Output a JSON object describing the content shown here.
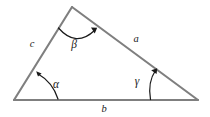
{
  "figure": {
    "background_color": "#ffffff",
    "side_color": "#7f7f7f",
    "annotation_color": "#1a1a1a",
    "vertices": {
      "bottom_left": [
        14,
        100
      ],
      "apex": [
        72,
        7
      ],
      "bottom_right": [
        198,
        100
      ]
    },
    "sides": [
      {
        "key": "a",
        "label": "a",
        "label_x": 136,
        "label_y": 42,
        "from": "apex",
        "to": "bottom_right"
      },
      {
        "key": "b",
        "label": "b",
        "label_x": 104,
        "label_y": 112,
        "from": "bottom_left",
        "to": "bottom_right"
      },
      {
        "key": "c",
        "label": "c",
        "label_x": 32,
        "label_y": 47,
        "from": "bottom_left",
        "to": "apex"
      }
    ],
    "angles": [
      {
        "key": "alpha",
        "label": "α",
        "label_x": 56,
        "label_y": 88,
        "at_vertex": "bottom_left"
      },
      {
        "key": "beta",
        "label": "β",
        "label_x": 74,
        "label_y": 48,
        "at_vertex": "apex"
      },
      {
        "key": "gamma",
        "label": "γ",
        "label_x": 137,
        "label_y": 85,
        "at_vertex": "bottom_right"
      }
    ]
  }
}
